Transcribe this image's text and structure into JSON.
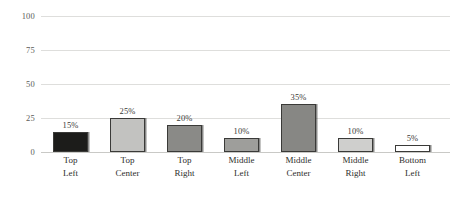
{
  "chart_data": {
    "type": "bar",
    "title": "",
    "subtitle": "",
    "xlabel": "",
    "ylabel": "",
    "ylim": [
      0,
      100
    ],
    "yticks": [
      0,
      25,
      50,
      75,
      100
    ],
    "ytick_labels": [
      "0",
      "25",
      "50",
      "75",
      "100"
    ],
    "grid": true,
    "legend": false,
    "legend_position": "none",
    "categories": [
      "Top Left",
      "Top Center",
      "Top Right",
      "Middle Left",
      "Middle Center",
      "Middle Right",
      "Bottom Left"
    ],
    "category_lines": [
      [
        "Top",
        "Left"
      ],
      [
        "Top",
        "Center"
      ],
      [
        "Top",
        "Right"
      ],
      [
        "Middle",
        "Left"
      ],
      [
        "Middle",
        "Center"
      ],
      [
        "Middle",
        "Right"
      ],
      [
        "Bottom",
        "Left"
      ]
    ],
    "values": [
      15,
      25,
      20,
      10,
      35,
      10,
      5
    ],
    "value_labels": [
      "15%",
      "25%",
      "20%",
      "10%",
      "35%",
      "10%",
      "5%"
    ],
    "bar_colors": [
      "#1c1c1a",
      "#c2c2c0",
      "#8a8a87",
      "#9e9e9b",
      "#878784",
      "#cfcfcd",
      "#ffffff"
    ],
    "bar_border_color": "#3a3a38",
    "gridline_color": "#dededc",
    "axis_color": "#c9c9c6",
    "text_color": "#2e2e2c",
    "tick_text_color": "#5b5b58",
    "background_color": "#ffffff"
  }
}
